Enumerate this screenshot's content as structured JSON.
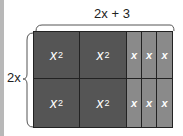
{
  "labels": {
    "top_width": "2x + 3",
    "side_height": "2x"
  },
  "tiles": {
    "square_label": "x",
    "square_exp": "2",
    "strip_label": "x"
  },
  "colors": {
    "square": "#555555",
    "strip": "#8a8a8a",
    "border": "#222222"
  }
}
